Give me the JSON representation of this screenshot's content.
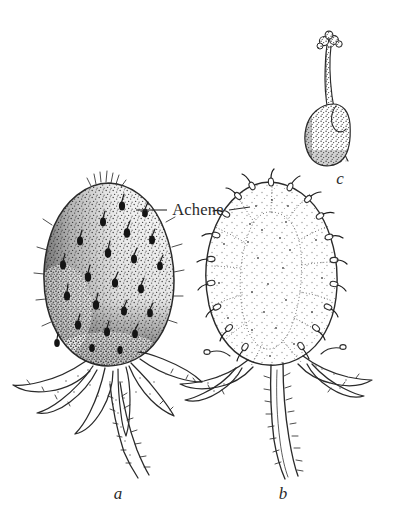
{
  "figure": {
    "kind": "botanical-line-illustration",
    "background_color": "#ffffff",
    "ink_color": "#2a2a2a",
    "width": 403,
    "height": 526
  },
  "callouts": [
    {
      "id": "achene",
      "text": "Achene",
      "leader_left": true,
      "leader_right": true
    }
  ],
  "panels": [
    {
      "id": "a",
      "label": "a",
      "label_style": "italic",
      "caption_x": 118,
      "caption_y": 499,
      "description": "Whole strawberry fruit, surface view, stippled receptacle with embedded achenes, reflexed hairy calyx and pedicel"
    },
    {
      "id": "b",
      "label": "b",
      "label_style": "italic",
      "caption_x": 283,
      "caption_y": 499,
      "description": "Longitudinal section of strawberry showing pith, radiating vascular strands and achenes in outline"
    },
    {
      "id": "c",
      "label": "c",
      "label_style": "italic",
      "caption_x": 340,
      "caption_y": 184,
      "description": "Single achene enlarged, with persistent curved style and lobed stigma"
    }
  ],
  "colors": {
    "ink": "#2a2a2a",
    "achene_fill": "#141414",
    "stipple": "#555555",
    "paper": "#ffffff"
  }
}
